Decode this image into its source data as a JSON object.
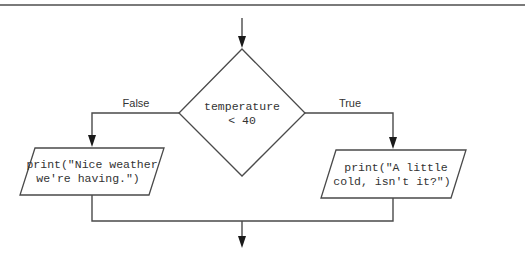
{
  "diagram": {
    "type": "flowchart",
    "decision": {
      "line1": "temperature",
      "line2": "< 40"
    },
    "branches": {
      "false_label": "False",
      "true_label": "True"
    },
    "false_action": {
      "line1": "print(\"Nice weather",
      "line2": "we're having.\")"
    },
    "true_action": {
      "line1": "print(\"A little",
      "line2": "cold, isn't it?\")"
    },
    "colors": {
      "stroke": "#4a4a4a",
      "text": "#333333",
      "background": "#ffffff"
    }
  }
}
